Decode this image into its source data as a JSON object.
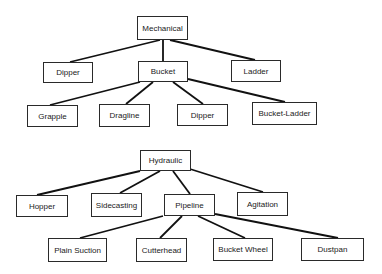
{
  "trees": [
    {
      "root": "Mechanical",
      "nodes": [
        {
          "id": "mechanical",
          "label": "Mechanical",
          "parent": null
        },
        {
          "id": "dipper-1",
          "label": "Dipper",
          "parent": "mechanical"
        },
        {
          "id": "bucket",
          "label": "Bucket",
          "parent": "mechanical"
        },
        {
          "id": "ladder",
          "label": "Ladder",
          "parent": "mechanical"
        },
        {
          "id": "grapple",
          "label": "Grapple",
          "parent": "bucket"
        },
        {
          "id": "dragline",
          "label": "Dragline",
          "parent": "bucket"
        },
        {
          "id": "dipper-2",
          "label": "Dipper",
          "parent": "bucket"
        },
        {
          "id": "bucket-ladder",
          "label": "Bucket-Ladder",
          "parent": "bucket"
        }
      ]
    },
    {
      "root": "Hydraulic",
      "nodes": [
        {
          "id": "hydraulic",
          "label": "Hydraulic",
          "parent": null
        },
        {
          "id": "hopper",
          "label": "Hopper",
          "parent": "hydraulic"
        },
        {
          "id": "sidecasting",
          "label": "Sidecasting",
          "parent": "hydraulic"
        },
        {
          "id": "pipeline",
          "label": "Pipeline",
          "parent": "hydraulic"
        },
        {
          "id": "agitation",
          "label": "Agitation",
          "parent": "hydraulic"
        },
        {
          "id": "plain-suction",
          "label": "Plain Suction",
          "parent": "pipeline"
        },
        {
          "id": "cutterhead",
          "label": "Cutterhead",
          "parent": "pipeline"
        },
        {
          "id": "bucket-wheel",
          "label": "Bucket Wheel",
          "parent": "pipeline"
        },
        {
          "id": "dustpan",
          "label": "Dustpan",
          "parent": "pipeline"
        }
      ]
    }
  ]
}
